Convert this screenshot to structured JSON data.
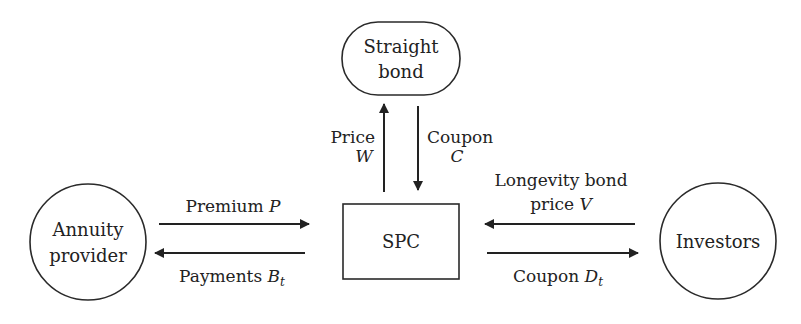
{
  "diagram": {
    "colors": {
      "stroke": "#2a2a2a",
      "text": "#222222",
      "background": "#ffffff"
    },
    "nodes": {
      "straight_bond": {
        "line1": "Straight",
        "line2": "bond",
        "shape": "rounded-rectangle"
      },
      "spc": {
        "label": "SPC",
        "shape": "rectangle"
      },
      "annuity_provider": {
        "line1": "Annuity",
        "line2": "provider",
        "shape": "circle"
      },
      "investors": {
        "label": "Investors",
        "shape": "circle"
      }
    },
    "edges": {
      "price_w": {
        "line1": "Price",
        "line2": "W",
        "from": "SPC",
        "to": "Straight bond"
      },
      "coupon_c": {
        "line1": "Coupon",
        "line2": "C",
        "from": "Straight bond",
        "to": "SPC"
      },
      "premium_p": {
        "text": "Premium ",
        "var": "P",
        "from": "Annuity provider",
        "to": "SPC"
      },
      "payments_bt": {
        "text": "Payments ",
        "var": "B",
        "sub": "t",
        "from": "SPC",
        "to": "Annuity provider"
      },
      "longevity_v": {
        "line1": "Longevity bond",
        "line2_text": "price ",
        "line2_var": "V",
        "from": "Investors",
        "to": "SPC"
      },
      "coupon_dt": {
        "text": "Coupon ",
        "var": "D",
        "sub": "t",
        "from": "SPC",
        "to": "Investors"
      }
    }
  }
}
